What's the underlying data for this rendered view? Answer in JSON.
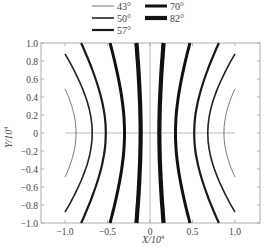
{
  "chart_data": {
    "type": "line",
    "title": "",
    "xlabel": "X/10^4",
    "ylabel": "Y/10^4",
    "xlabel_display": "X/10",
    "ylabel_display": "Y/10",
    "label_exponent": "4",
    "xlim": [
      -1.25,
      1.3
    ],
    "ylim": [
      -1.0,
      1.0
    ],
    "x_ticks": [
      -1.0,
      -0.5,
      0,
      0.5,
      1.0
    ],
    "x_tick_labels": [
      "−1.0",
      "−0.5",
      "0",
      "0.5",
      "1.0"
    ],
    "y_ticks": [
      1.0,
      0.8,
      0.6,
      0.4,
      0.2,
      0,
      -0.2,
      -0.4,
      -0.6,
      -0.8,
      -1.0
    ],
    "y_tick_labels": [
      "1.0",
      "0.8",
      "0.6",
      "0.4",
      "0.2",
      "0",
      "−0.2",
      "−0.4",
      "−0.6",
      "−0.8",
      "−1.0"
    ],
    "grid": false,
    "reference_lines": {
      "horizontal_y0": [
        -1.0,
        1.0
      ],
      "vertical_x0": [
        -1.0,
        1.0
      ]
    },
    "legend": {
      "position": "top",
      "columns": 2
    },
    "series": [
      {
        "name": "43°",
        "vertex_x": 0.87,
        "x_at_y_edge": 1.0,
        "y_range": [
          -0.49,
          0.49
        ],
        "line_width": 0.8,
        "color": "#555555"
      },
      {
        "name": "50°",
        "vertex_x": 0.68,
        "x_at_y_edge": 1.0,
        "y_range": [
          -0.88,
          0.88
        ],
        "line_width": 1.6,
        "color": "#222222"
      },
      {
        "name": "57°",
        "vertex_x": 0.52,
        "x_at_y_edge": 0.81,
        "y_range": [
          -1.0,
          1.0
        ],
        "line_width": 2.2,
        "color": "#1a1a1a"
      },
      {
        "name": "70°",
        "vertex_x": 0.3,
        "x_at_y_edge": 0.47,
        "y_range": [
          -1.0,
          1.0
        ],
        "line_width": 3.0,
        "color": "#111111"
      },
      {
        "name": "82°",
        "vertex_x": 0.11,
        "x_at_y_edge": 0.16,
        "y_range": [
          -1.0,
          1.0
        ],
        "line_width": 4.2,
        "color": "#111111"
      }
    ],
    "symmetry": "each series is a pair of hyperbola-like branches mirrored about X=0 (x = ±f(y)), symmetric about Y=0"
  },
  "caption": "图 3  ···  水平分布"
}
